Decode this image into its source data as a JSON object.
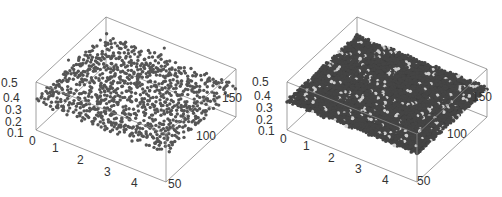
{
  "chart_data": [
    {
      "type": "scatter",
      "dimensions": "3d",
      "title": "",
      "description": "3D scatter of sparse points, most lying near a plane around z≈0.3, some outliers up to z≈0.5",
      "xlabel": "",
      "ylabel": "",
      "zlabel": "",
      "x_ticks": [
        "0",
        "1",
        "2",
        "3",
        "4"
      ],
      "y_ticks": [
        "50",
        "100",
        "150"
      ],
      "z_ticks": [
        "0.1",
        "0.2",
        "0.3",
        "0.4",
        "0.5"
      ],
      "xlim": [
        0,
        5
      ],
      "ylim": [
        50,
        150
      ],
      "zlim": [
        0,
        0.5
      ],
      "grid": false,
      "marker_color": "#555555",
      "box_color": "#888888",
      "point_count_approx": 1200,
      "seed": 7,
      "density": 0.55,
      "outliers": 30,
      "style": "scatter"
    },
    {
      "type": "scatter",
      "dimensions": "3d",
      "title": "",
      "description": "3D dense point cloud forming a nearly flat surface at z≈0.3",
      "xlabel": "",
      "ylabel": "",
      "zlabel": "",
      "x_ticks": [
        "0",
        "1",
        "2",
        "3",
        "4"
      ],
      "y_ticks": [
        "50",
        "100",
        "150"
      ],
      "z_ticks": [
        "0.1",
        "0.2",
        "0.3",
        "0.4",
        "0.5"
      ],
      "xlim": [
        0,
        5
      ],
      "ylim": [
        50,
        150
      ],
      "zlim": [
        0,
        0.5
      ],
      "grid": false,
      "marker_color": "#444444",
      "box_color": "#888888",
      "surface_level": 0.3,
      "seed": 13,
      "density": 1.0,
      "outliers": 0,
      "style": "surface"
    }
  ],
  "labels": {
    "left": {
      "z": [
        "0.5",
        "0.4",
        "0.3",
        "0.2",
        "0.1",
        "0"
      ],
      "x": [
        "1",
        "2",
        "3",
        "4"
      ],
      "y": [
        "150",
        "100",
        "50"
      ]
    },
    "right": {
      "z": [
        "0.5",
        "0.4",
        "0.3",
        "0.2",
        "0.1",
        "0"
      ],
      "x": [
        "1",
        "2",
        "3",
        "4"
      ],
      "y": [
        "150",
        "100",
        "50"
      ]
    }
  }
}
